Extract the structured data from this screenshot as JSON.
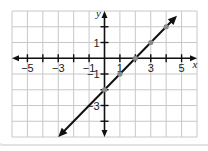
{
  "chart_data": {
    "type": "line",
    "title": "",
    "xlabel": "x",
    "ylabel": "y",
    "xlim": [
      -6,
      6
    ],
    "ylim": [
      -5,
      3
    ],
    "grid": true,
    "x_tick_labels": [
      {
        "value": -5,
        "label": "−5"
      },
      {
        "value": -3,
        "label": "−3"
      },
      {
        "value": -1,
        "label": "−1"
      },
      {
        "value": 1,
        "label": "1"
      },
      {
        "value": 3,
        "label": "3"
      },
      {
        "value": 5,
        "label": "5"
      }
    ],
    "y_tick_labels": [
      {
        "value": 1,
        "label": "1"
      },
      {
        "value": -1,
        "label": "−1"
      },
      {
        "value": -3,
        "label": "−3"
      }
    ],
    "x_ticks": [
      -5,
      -4,
      -3,
      -2,
      -1,
      1,
      2,
      3,
      4,
      5
    ],
    "y_ticks": [
      2,
      1,
      -1,
      -2,
      -3,
      -4
    ],
    "series": [
      {
        "name": "y = x − 2",
        "line_endpoints": [
          {
            "x": -3,
            "y": -5
          },
          {
            "x": 4.7,
            "y": 2.7
          }
        ],
        "arrows_both_ends": true,
        "points": [
          {
            "x": 0,
            "y": -2
          },
          {
            "x": 1,
            "y": -1
          },
          {
            "x": 2,
            "y": 0
          },
          {
            "x": 3,
            "y": 1
          },
          {
            "x": 4,
            "y": 2
          }
        ]
      }
    ],
    "colors": {
      "line": "#111111",
      "grid": "#c8c8c8",
      "axis": "#111111",
      "point": "#8a8a8a"
    }
  }
}
